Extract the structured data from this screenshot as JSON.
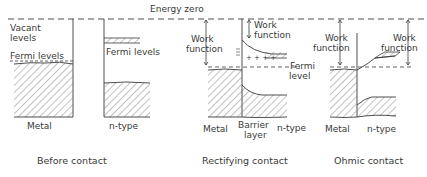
{
  "top_label": "Energy  zero",
  "panels": {
    "before": {
      "caption": "Before contact",
      "vacant_levels_line1": "Vacant",
      "vacant_levels_line2": "levels",
      "fermi_levels_metal": "Fermi levels",
      "fermi_levels_semi": "Fermi levels",
      "metal": "Metal",
      "ntype": "n-type"
    },
    "rectifying": {
      "caption": "Rectifying contact",
      "work_function_left_1": "Work",
      "work_function_left_2": "function",
      "work_function_right_1": "Work",
      "work_function_right_2": "function",
      "fermi_1": "Fermi",
      "fermi_2": "level",
      "metal": "Metal",
      "barrier_1": "Barrier",
      "barrier_2": "layer",
      "ntype": "n-type"
    },
    "ohmic": {
      "caption": "Ohmic contact",
      "work_function_left_1": "Work",
      "work_function_left_2": "function",
      "work_function_right_1": "Work",
      "work_function_right_2": "function",
      "metal": "Metal",
      "ntype": "n-type"
    }
  },
  "colors": {
    "ink": "#3a3a3a",
    "hatch": "#6a6a6a",
    "background": "#ffffff"
  }
}
